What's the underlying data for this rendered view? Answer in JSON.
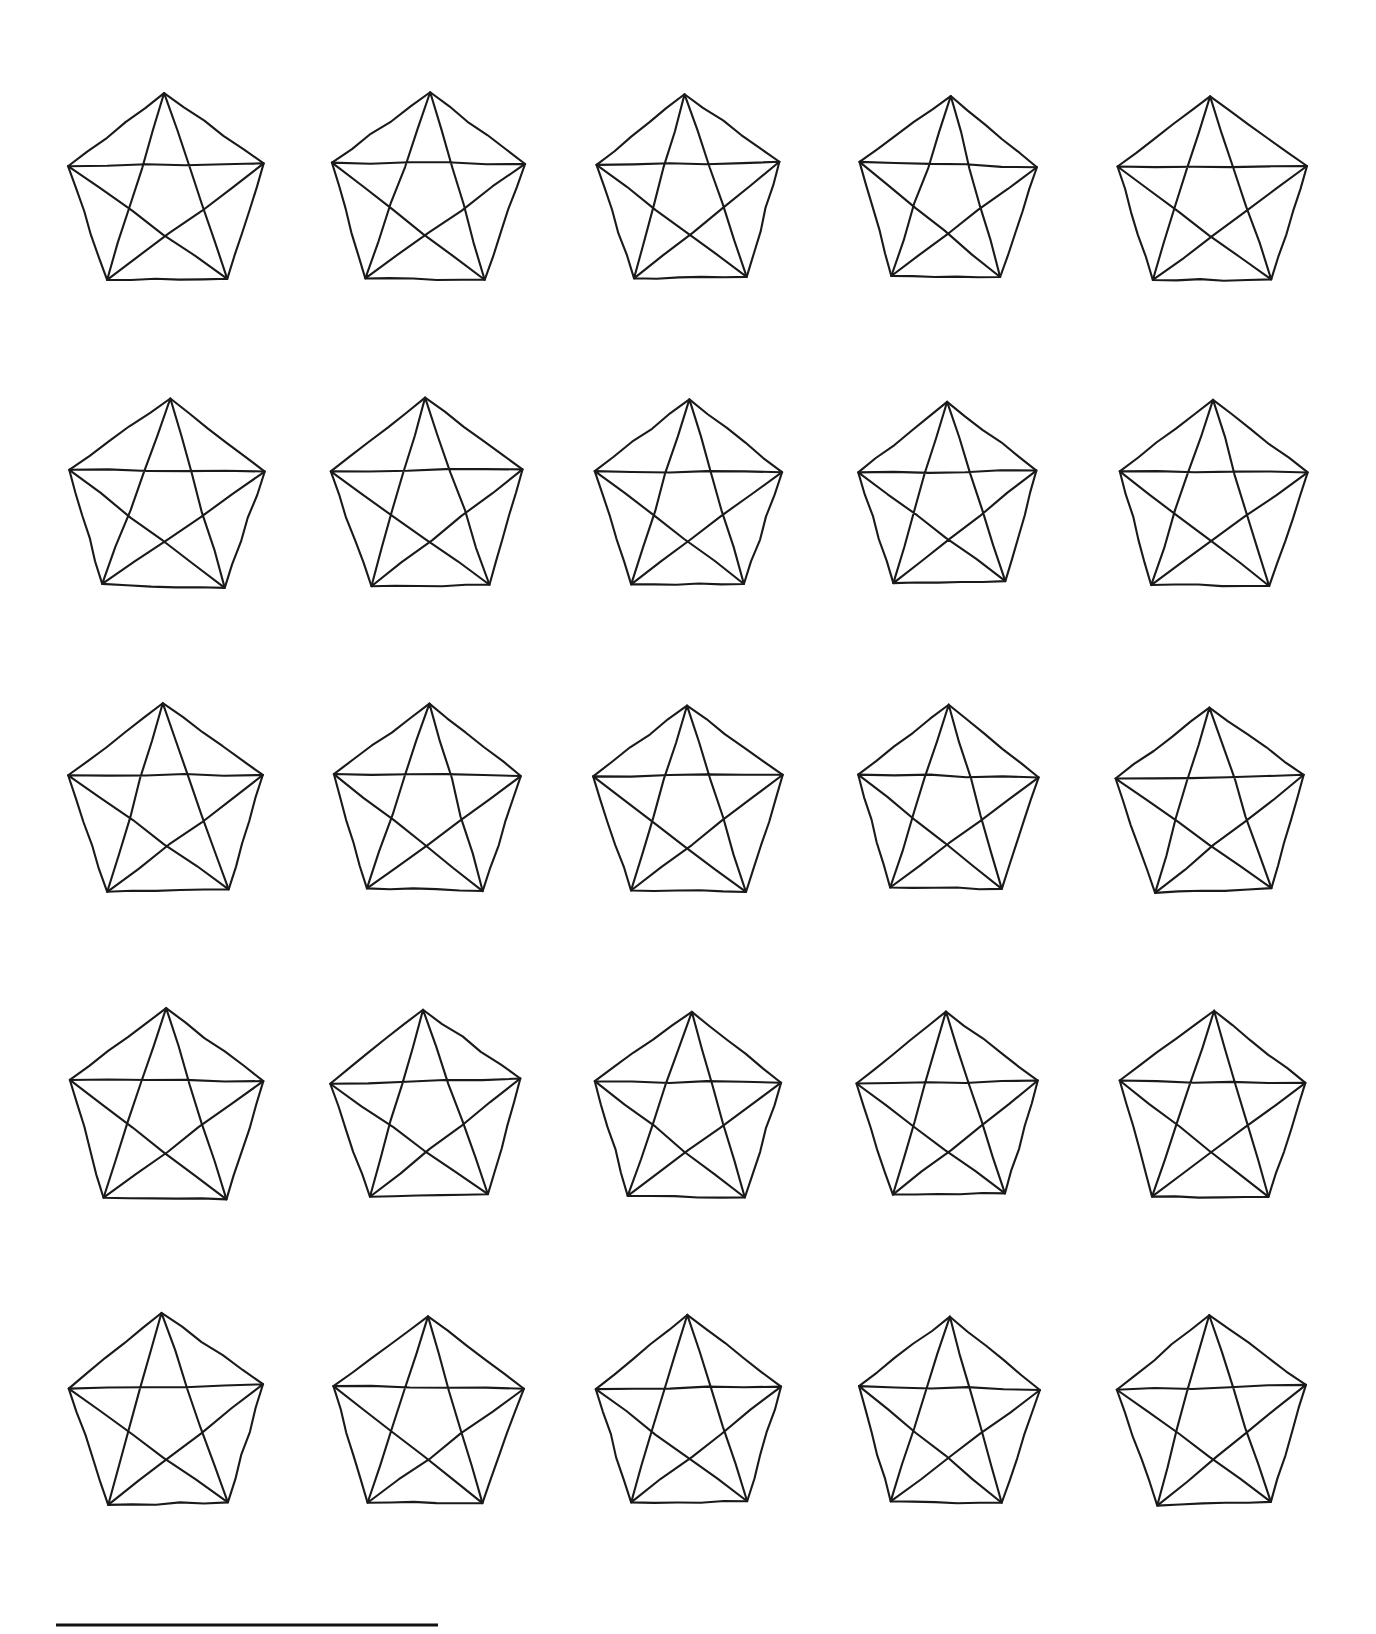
{
  "page": {
    "background_color": "#ffffff",
    "ink_color": "#1a1a1a",
    "width": 1376,
    "height": 1634
  },
  "figure": {
    "rows": 5,
    "columns": 5,
    "shape_count": 25,
    "shape_name": "pentagon-with-diagonals",
    "stroke_color": "#1a1a1a",
    "stroke_width": 2.1,
    "grid": {
      "column_centers": [
        166,
        427,
        688,
        948,
        1212
      ],
      "row_apex_y": [
        96,
        402,
        707,
        1013,
        1319
      ],
      "column_spacing": 261,
      "row_spacing": 306
    },
    "cells": [
      {
        "row": 1,
        "col": 1,
        "cx": 166,
        "cy": 196,
        "rx": 103,
        "ry": 104,
        "rot": -1.0,
        "skew": 0.01,
        "jitter": 1.6
      },
      {
        "row": 1,
        "col": 2,
        "cx": 427,
        "cy": 196,
        "rx": 101,
        "ry": 104,
        "rot": 0.6,
        "skew": -0.008,
        "jitter": 1.5
      },
      {
        "row": 1,
        "col": 3,
        "cx": 688,
        "cy": 196,
        "rx": 97,
        "ry": 102,
        "rot": -0.8,
        "skew": 0.012,
        "jitter": 1.7
      },
      {
        "row": 1,
        "col": 4,
        "cx": 948,
        "cy": 196,
        "rx": 94,
        "ry": 100,
        "rot": 1.2,
        "skew": -0.01,
        "jitter": 1.4
      },
      {
        "row": 1,
        "col": 5,
        "cx": 1212,
        "cy": 198,
        "rx": 100,
        "ry": 102,
        "rot": -0.5,
        "skew": 0.006,
        "jitter": 1.6
      },
      {
        "row": 2,
        "col": 1,
        "cx": 166,
        "cy": 502,
        "rx": 103,
        "ry": 104,
        "rot": 0.9,
        "skew": -0.012,
        "jitter": 1.6
      },
      {
        "row": 2,
        "col": 2,
        "cx": 427,
        "cy": 502,
        "rx": 100,
        "ry": 103,
        "rot": -1.1,
        "skew": 0.009,
        "jitter": 1.5
      },
      {
        "row": 2,
        "col": 3,
        "cx": 688,
        "cy": 502,
        "rx": 97,
        "ry": 101,
        "rot": 0.7,
        "skew": -0.007,
        "jitter": 1.8
      },
      {
        "row": 2,
        "col": 4,
        "cx": 948,
        "cy": 502,
        "rx": 95,
        "ry": 100,
        "rot": -0.6,
        "skew": 0.011,
        "jitter": 1.5
      },
      {
        "row": 2,
        "col": 5,
        "cx": 1212,
        "cy": 503,
        "rx": 99,
        "ry": 102,
        "rot": 1.0,
        "skew": -0.006,
        "jitter": 1.7
      },
      {
        "row": 3,
        "col": 1,
        "cx": 166,
        "cy": 807,
        "rx": 102,
        "ry": 104,
        "rot": -0.7,
        "skew": 0.008,
        "jitter": 1.6
      },
      {
        "row": 3,
        "col": 2,
        "cx": 427,
        "cy": 807,
        "rx": 99,
        "ry": 102,
        "rot": 1.1,
        "skew": -0.01,
        "jitter": 1.5
      },
      {
        "row": 3,
        "col": 3,
        "cx": 688,
        "cy": 808,
        "rx": 99,
        "ry": 103,
        "rot": -0.4,
        "skew": 0.007,
        "jitter": 1.4
      },
      {
        "row": 3,
        "col": 4,
        "cx": 948,
        "cy": 807,
        "rx": 96,
        "ry": 101,
        "rot": 0.8,
        "skew": -0.009,
        "jitter": 1.6
      },
      {
        "row": 3,
        "col": 5,
        "cx": 1212,
        "cy": 808,
        "rx": 99,
        "ry": 102,
        "rot": -1.0,
        "skew": 0.01,
        "jitter": 1.7
      },
      {
        "row": 4,
        "col": 1,
        "cx": 166,
        "cy": 1113,
        "rx": 103,
        "ry": 105,
        "rot": 0.5,
        "skew": -0.008,
        "jitter": 1.6
      },
      {
        "row": 4,
        "col": 2,
        "cx": 427,
        "cy": 1113,
        "rx": 100,
        "ry": 103,
        "rot": -0.9,
        "skew": 0.011,
        "jitter": 1.5
      },
      {
        "row": 4,
        "col": 3,
        "cx": 688,
        "cy": 1113,
        "rx": 98,
        "ry": 102,
        "rot": 1.0,
        "skew": -0.007,
        "jitter": 1.8
      },
      {
        "row": 4,
        "col": 4,
        "cx": 948,
        "cy": 1113,
        "rx": 96,
        "ry": 101,
        "rot": -0.6,
        "skew": 0.009,
        "jitter": 1.5
      },
      {
        "row": 4,
        "col": 5,
        "cx": 1212,
        "cy": 1114,
        "rx": 99,
        "ry": 103,
        "rot": 0.7,
        "skew": -0.011,
        "jitter": 1.6
      },
      {
        "row": 5,
        "col": 1,
        "cx": 166,
        "cy": 1419,
        "rx": 103,
        "ry": 105,
        "rot": -1.1,
        "skew": 0.012,
        "jitter": 1.7
      },
      {
        "row": 5,
        "col": 2,
        "cx": 427,
        "cy": 1419,
        "rx": 100,
        "ry": 104,
        "rot": 0.8,
        "skew": -0.009,
        "jitter": 1.5
      },
      {
        "row": 5,
        "col": 3,
        "cx": 688,
        "cy": 1419,
        "rx": 98,
        "ry": 103,
        "rot": -0.5,
        "skew": 0.007,
        "jitter": 1.6
      },
      {
        "row": 5,
        "col": 4,
        "cx": 948,
        "cy": 1419,
        "rx": 96,
        "ry": 102,
        "rot": 1.1,
        "skew": -0.01,
        "jitter": 1.5
      },
      {
        "row": 5,
        "col": 5,
        "cx": 1212,
        "cy": 1420,
        "rx": 99,
        "ry": 104,
        "rot": -0.8,
        "skew": 0.008,
        "jitter": 1.7
      }
    ]
  },
  "bottom_rule": {
    "name": "bottom-horizontal-rule",
    "x1": 56,
    "x2": 438,
    "y": 1625,
    "thickness": 3,
    "color": "#111111"
  }
}
